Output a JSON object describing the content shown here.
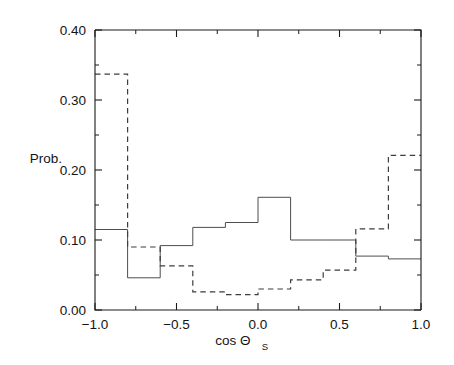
{
  "chart_data": {
    "type": "line",
    "subtype": "step-histogram",
    "title": "",
    "xlabel": "cos Θ",
    "xlabel_main": "cos Θ",
    "xlabel_sub": "S",
    "ylabel": "Prob.",
    "xlim": [
      -1.0,
      1.0
    ],
    "ylim": [
      0.0,
      0.4
    ],
    "grid": false,
    "legend": "none",
    "bin_edges": [
      -1.0,
      -0.8,
      -0.6,
      -0.4,
      -0.2,
      0.0,
      0.2,
      0.4,
      0.6,
      0.8,
      1.0
    ],
    "bin_centers": [
      -0.9,
      -0.7,
      -0.5,
      -0.3,
      -0.1,
      0.1,
      0.3,
      0.5,
      0.7,
      0.9
    ],
    "series": [
      {
        "name": "solid",
        "style": "solid",
        "color": "#4d4d4d",
        "values": [
          0.115,
          0.046,
          0.092,
          0.118,
          0.125,
          0.161,
          0.1,
          0.1,
          0.077,
          0.073
        ]
      },
      {
        "name": "dashed",
        "style": "dashed",
        "color": "#3d3d3d",
        "values": [
          0.337,
          0.09,
          0.063,
          0.026,
          0.022,
          0.03,
          0.043,
          0.057,
          0.116,
          0.221
        ]
      }
    ],
    "xticks": [
      -1.0,
      -0.5,
      0.0,
      0.5,
      1.0
    ],
    "xticklabels": [
      "-1.0",
      "-0.5",
      "0.0",
      "0.5",
      "1.0"
    ],
    "xticks_minor": [
      -0.75,
      -0.25,
      0.25,
      0.75
    ],
    "yticks": [
      0.0,
      0.1,
      0.2,
      0.3,
      0.4
    ],
    "yticklabels": [
      "0.00",
      "0.10",
      "0.20",
      "0.30",
      "0.40"
    ],
    "yticks_minor": [
      0.05,
      0.15,
      0.25,
      0.35
    ]
  },
  "axes": {
    "ylabel": "Prob.",
    "xlabel_main": "cos Θ",
    "xlabel_sub": "S"
  }
}
